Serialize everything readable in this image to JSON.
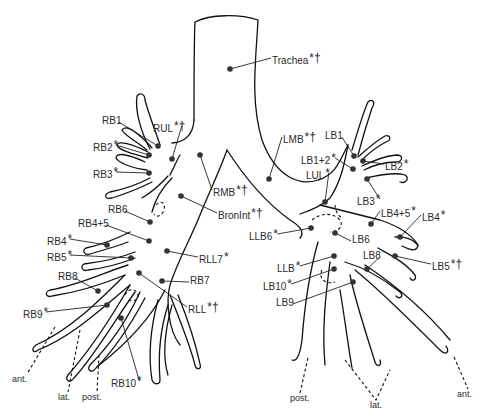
{
  "diagram": {
    "colors": {
      "line": "#111111",
      "dot": "#333333",
      "text": "#2a2a2a",
      "background": "#ffffff"
    },
    "labels": [
      {
        "id": "trachea",
        "text": "Trachea",
        "marks": "*†",
        "x": 272,
        "y": 52,
        "dot": [
          230,
          69
        ]
      },
      {
        "id": "rul",
        "text": "RUL",
        "marks": "*†",
        "x": 153,
        "y": 120,
        "dot": [
          172,
          159
        ]
      },
      {
        "id": "rb1",
        "text": "RB1",
        "marks": "",
        "x": 102,
        "y": 116,
        "dot": [
          158,
          146
        ]
      },
      {
        "id": "rb2",
        "text": "RB2",
        "marks": "*",
        "x": 93,
        "y": 139,
        "dot": [
          149,
          155
        ]
      },
      {
        "id": "rb3",
        "text": "RB3",
        "marks": "*",
        "x": 93,
        "y": 166,
        "dot": [
          149,
          173
        ]
      },
      {
        "id": "rmb",
        "text": "RMB",
        "marks": "*†",
        "x": 213,
        "y": 184,
        "dot": [
          200,
          155
        ]
      },
      {
        "id": "bronint",
        "text": "BronInt",
        "marks": "*†",
        "x": 218,
        "y": 207,
        "dot": [
          181,
          196
        ]
      },
      {
        "id": "rb6",
        "text": "RB6",
        "marks": "",
        "x": 108,
        "y": 205,
        "dot": [
          150,
          222
        ]
      },
      {
        "id": "rb4p5",
        "text": "RB4+5",
        "marks": "",
        "x": 78,
        "y": 219,
        "dot": [
          149,
          241
        ]
      },
      {
        "id": "rb4",
        "text": "RB4",
        "marks": "*",
        "x": 47,
        "y": 233,
        "dot": [
          107,
          245
        ]
      },
      {
        "id": "rb5",
        "text": "RB5",
        "marks": "*",
        "x": 47,
        "y": 249,
        "dot": [
          131,
          258
        ]
      },
      {
        "id": "rll7",
        "text": "RLL7",
        "marks": "*",
        "x": 199,
        "y": 251,
        "dot": [
          167,
          251
        ]
      },
      {
        "id": "rb8",
        "text": "RB8",
        "marks": "",
        "x": 58,
        "y": 272,
        "dot": [
          98,
          291
        ]
      },
      {
        "id": "rb7",
        "text": "RB7",
        "marks": "",
        "x": 190,
        "y": 276,
        "dot": [
          162,
          281
        ]
      },
      {
        "id": "rll",
        "text": "RLL",
        "marks": "*†",
        "x": 188,
        "y": 301,
        "dot": [
          139,
          273
        ]
      },
      {
        "id": "rb9",
        "text": "RB9",
        "marks": "*",
        "x": 23,
        "y": 306,
        "dot": [
          107,
          305
        ]
      },
      {
        "id": "rb10",
        "text": "RB10",
        "marks": "*",
        "x": 111,
        "y": 375,
        "dot": [
          121,
          318
        ]
      },
      {
        "id": "lmb",
        "text": "LMB",
        "marks": "*†",
        "x": 283,
        "y": 131,
        "dot": [
          269,
          179
        ]
      },
      {
        "id": "lb1",
        "text": "LB1",
        "marks": "",
        "x": 325,
        "y": 131,
        "dot": [
          354,
          156
        ]
      },
      {
        "id": "lb1p2",
        "text": "LB1+2",
        "marks": "*",
        "x": 301,
        "y": 152,
        "dot": [
          353,
          169
        ]
      },
      {
        "id": "lb2",
        "text": "LB2",
        "marks": "*",
        "x": 385,
        "y": 158,
        "dot": [
          363,
          161
        ]
      },
      {
        "id": "lul",
        "text": "LUL",
        "marks": "*",
        "x": 306,
        "y": 167,
        "dot": [
          325,
          202
        ]
      },
      {
        "id": "lb3",
        "text": "LB3",
        "marks": "*",
        "x": 357,
        "y": 193,
        "dot": [
          367,
          179
        ]
      },
      {
        "id": "lb4p5",
        "text": "LB4+5",
        "marks": "*",
        "x": 381,
        "y": 205,
        "dot": [
          371,
          224
        ]
      },
      {
        "id": "lb4",
        "text": "LB4",
        "marks": "*",
        "x": 422,
        "y": 209,
        "dot": [
          400,
          237
        ]
      },
      {
        "id": "llb6",
        "text": "LLB6",
        "marks": "*",
        "x": 249,
        "y": 228,
        "dot": [
          311,
          228
        ]
      },
      {
        "id": "lb6",
        "text": "LB6",
        "marks": "",
        "x": 352,
        "y": 235,
        "dot": [
          335,
          233
        ]
      },
      {
        "id": "lb8",
        "text": "LB8",
        "marks": "",
        "x": 363,
        "y": 251,
        "dot": [
          367,
          269
        ]
      },
      {
        "id": "lb5",
        "text": "LB5",
        "marks": "*†",
        "x": 432,
        "y": 258,
        "dot": [
          395,
          256
        ]
      },
      {
        "id": "llb",
        "text": "LLB",
        "marks": "*",
        "x": 277,
        "y": 260,
        "dot": [
          334,
          256
        ]
      },
      {
        "id": "lb10",
        "text": "LB10",
        "marks": "*",
        "x": 263,
        "y": 278,
        "dot": [
          334,
          269
        ]
      },
      {
        "id": "lb9",
        "text": "LB9",
        "marks": "",
        "x": 276,
        "y": 298,
        "dot": [
          353,
          282
        ]
      }
    ],
    "directions": [
      {
        "id": "right-ant",
        "text": "ant.",
        "x": 12,
        "y": 375,
        "line": [
          [
            55,
            327
          ],
          [
            27,
            374
          ]
        ]
      },
      {
        "id": "right-lat",
        "text": "lat.",
        "x": 58,
        "y": 393,
        "line": [
          [
            80,
            330
          ],
          [
            68,
            392
          ]
        ]
      },
      {
        "id": "right-post",
        "text": "post.",
        "x": 82,
        "y": 393,
        "line": [
          [
            99,
            355
          ],
          [
            97,
            392
          ]
        ]
      },
      {
        "id": "left-post",
        "text": "post.",
        "x": 290,
        "y": 394,
        "line": [
          [
            308,
            358
          ],
          [
            300,
            393
          ]
        ]
      },
      {
        "id": "left-lat",
        "text": "lat.",
        "x": 370,
        "y": 401,
        "line": [
          [
            345,
            360
          ],
          [
            376,
            400
          ],
          [
            390,
            370
          ]
        ]
      },
      {
        "id": "left-ant",
        "text": "ant.",
        "x": 457,
        "y": 390,
        "line": [
          [
            454,
            357
          ],
          [
            468,
            389
          ]
        ]
      }
    ]
  }
}
